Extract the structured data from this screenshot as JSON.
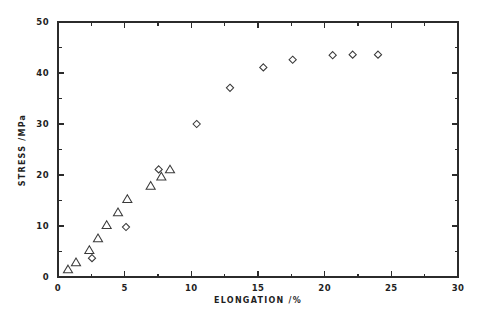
{
  "chart_data": {
    "type": "scatter",
    "title": "",
    "xlabel": "ELONGATION /%",
    "ylabel": "STRESS /MPa",
    "xlim": [
      0,
      30
    ],
    "ylim": [
      0,
      50
    ],
    "xticks": [
      0,
      5,
      10,
      15,
      20,
      25,
      30
    ],
    "yticks": [
      0,
      10,
      20,
      30,
      40,
      50
    ],
    "xticklabels": [
      "0",
      "5",
      "10",
      "15",
      "20",
      "25",
      "30"
    ],
    "yticklabels": [
      "0",
      "10",
      "20",
      "30",
      "40",
      "50"
    ],
    "x_minor_ticks": [
      2.5,
      7.5,
      12.5,
      17.5,
      22.5,
      27.5
    ],
    "y_minor_ticks": [
      5,
      15,
      25,
      35,
      45
    ],
    "grid": false,
    "legend": "none",
    "frame": "box",
    "series": [
      {
        "name": "triangle-series",
        "marker": "triangle",
        "filled": false,
        "points": [
          {
            "x": 0.75,
            "y": 1.5
          },
          {
            "x": 1.35,
            "y": 2.9
          },
          {
            "x": 2.35,
            "y": 5.3
          },
          {
            "x": 3.0,
            "y": 7.6
          },
          {
            "x": 3.65,
            "y": 10.2
          },
          {
            "x": 4.5,
            "y": 12.7
          },
          {
            "x": 5.2,
            "y": 15.3
          },
          {
            "x": 6.95,
            "y": 17.9
          },
          {
            "x": 7.75,
            "y": 19.7
          },
          {
            "x": 8.4,
            "y": 21.1
          }
        ]
      },
      {
        "name": "diamond-series",
        "marker": "diamond",
        "filled": false,
        "points": [
          {
            "x": 2.55,
            "y": 3.7
          },
          {
            "x": 5.1,
            "y": 9.8
          },
          {
            "x": 7.55,
            "y": 21.1
          },
          {
            "x": 10.4,
            "y": 30.0
          },
          {
            "x": 12.9,
            "y": 37.1
          },
          {
            "x": 15.4,
            "y": 41.1
          },
          {
            "x": 17.6,
            "y": 42.6
          },
          {
            "x": 20.6,
            "y": 43.5
          },
          {
            "x": 22.1,
            "y": 43.6
          },
          {
            "x": 24.0,
            "y": 43.6
          }
        ]
      }
    ]
  },
  "style": {
    "axis_color": "#2b2b2b",
    "marker_color": "#3a3a3a",
    "background": "#ffffff",
    "text_color": "#1f1f1f"
  }
}
